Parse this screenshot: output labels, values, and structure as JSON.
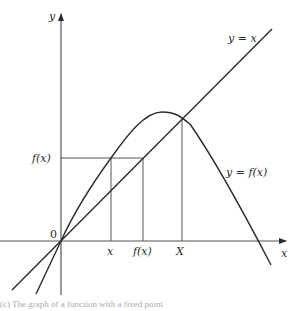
{
  "diagram": {
    "axes": {
      "x_label": "x",
      "y_label": "y",
      "origin_label": "0"
    },
    "curves": {
      "identity_label": "y = x",
      "function_label": "y = f(x)"
    },
    "markers": {
      "x_tick": "x",
      "fx_tick": "f(x)",
      "fixed_point_tick": "X",
      "fx_y_tick": "f(x)"
    },
    "caption": "(c) The graph of a function with a fixed point"
  },
  "colors": {
    "ink": "#2b2b2b",
    "guide": "#555555",
    "background": "#ffffff"
  }
}
